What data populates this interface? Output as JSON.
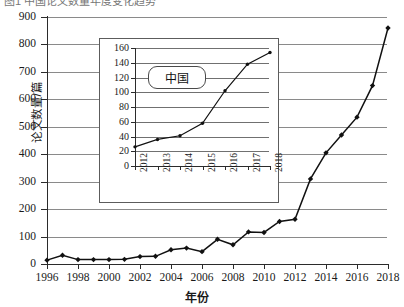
{
  "figure": {
    "cut_caption": "图1 中国论文数量年度变化趋势"
  },
  "chart_data": [
    {
      "type": "line",
      "title": "",
      "xlabel": "年份",
      "ylabel": "论文数量/篇",
      "x": [
        1996,
        1997,
        1998,
        1999,
        2000,
        2001,
        2002,
        2003,
        2004,
        2005,
        2006,
        2007,
        2008,
        2009,
        2010,
        2011,
        2012,
        2013,
        2014,
        2015,
        2016,
        2017,
        2018
      ],
      "values": [
        14,
        32,
        16,
        16,
        16,
        17,
        27,
        28,
        52,
        58,
        45,
        90,
        70,
        117,
        115,
        155,
        163,
        310,
        405,
        470,
        535,
        650,
        860
      ],
      "xlim": [
        1996,
        2018
      ],
      "ylim": [
        0,
        900
      ],
      "xticks": [
        1996,
        1998,
        2000,
        2002,
        2004,
        2006,
        2008,
        2010,
        2012,
        2014,
        2016,
        2018
      ],
      "yticks": [
        0,
        100,
        200,
        300,
        400,
        500,
        600,
        700,
        800,
        900
      ],
      "xticklabels": [
        "1996",
        "1998",
        "2000",
        "2002",
        "2004",
        "2006",
        "2008",
        "2010",
        "2012",
        "2014",
        "2016",
        "2018"
      ],
      "yticklabels": [
        "0",
        "100",
        "200",
        "300",
        "400",
        "500",
        "600",
        "700",
        "800",
        "900"
      ],
      "grid": "horizontal",
      "legend": "none",
      "marker": "diamond",
      "line_color": "#111111"
    },
    {
      "type": "line",
      "inset": true,
      "annotation": "中国",
      "xlabel": "",
      "ylabel": "",
      "x": [
        2012,
        2013,
        2014,
        2015,
        2016,
        2017,
        2018
      ],
      "values": [
        26,
        36,
        41,
        58,
        102,
        138,
        154
      ],
      "xlim": [
        2012,
        2018
      ],
      "ylim": [
        0,
        160
      ],
      "xticks": [
        2012,
        2013,
        2014,
        2015,
        2016,
        2017,
        2018
      ],
      "yticks": [
        0,
        20,
        40,
        60,
        80,
        100,
        120,
        140,
        160
      ],
      "xticklabels": [
        "2012",
        "2013",
        "2014",
        "2015",
        "2016",
        "2017",
        "2018"
      ],
      "yticklabels": [
        "0",
        "20",
        "40",
        "60",
        "80",
        "100",
        "120",
        "140",
        "160"
      ],
      "grid": "horizontal",
      "legend": "none",
      "marker": "dot",
      "line_color": "#111111"
    }
  ]
}
